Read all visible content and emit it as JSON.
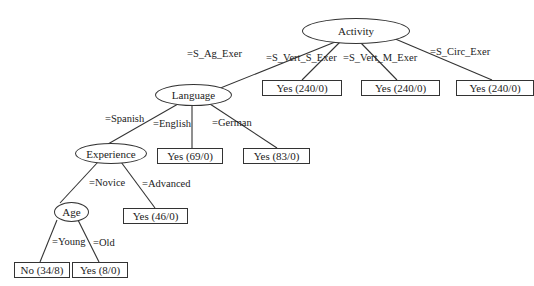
{
  "diagram": {
    "type": "decision-tree",
    "nodes": {
      "activity": {
        "label": "Activity"
      },
      "language": {
        "label": "Language"
      },
      "experience": {
        "label": "Experience"
      },
      "age": {
        "label": "Age"
      }
    },
    "leaves": {
      "vert_s": {
        "label": "Yes (240/0)"
      },
      "vert_m": {
        "label": "Yes (240/0)"
      },
      "circ": {
        "label": "Yes (240/0)"
      },
      "english": {
        "label": "Yes (69/0)"
      },
      "german": {
        "label": "Yes (83/0)"
      },
      "advanced": {
        "label": "Yes (46/0)"
      },
      "young": {
        "label": "No (34/8)"
      },
      "old": {
        "label": "Yes (8/0)"
      }
    },
    "edges": {
      "s_ag_exer": "=S_Ag_Exer",
      "s_vert_s_exer": "=S_Vert_S_Exer",
      "s_vert_m_exer": "=S_Vert_M_Exer",
      "s_circ_exer": "=S_Circ_Exer",
      "spanish": "=Spanish",
      "english": "=English",
      "german": "=German",
      "novice": "=Novice",
      "advanced": "=Advanced",
      "young": "=Young",
      "old": "=Old"
    }
  }
}
